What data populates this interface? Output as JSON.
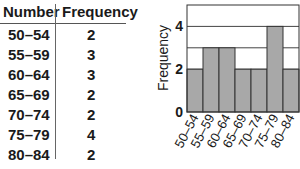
{
  "table": {
    "headers": [
      "Number",
      "Frequency"
    ],
    "rows": [
      [
        "50–54",
        "2"
      ],
      [
        "55–59",
        "3"
      ],
      [
        "60–64",
        "3"
      ],
      [
        "65–69",
        "2"
      ],
      [
        "70–74",
        "2"
      ],
      [
        "75–79",
        "4"
      ],
      [
        "80–84",
        "2"
      ]
    ]
  },
  "chart_data": {
    "type": "bar",
    "title": "",
    "xlabel": "",
    "ylabel": "Frequency",
    "categories": [
      "50–54",
      "55–59",
      "60–64",
      "65–69",
      "70–74",
      "75–79",
      "80–84"
    ],
    "values": [
      2,
      3,
      3,
      2,
      2,
      4,
      2
    ],
    "yticks": [
      "0",
      "2",
      "4"
    ],
    "ylim": [
      0,
      5
    ],
    "grid": true,
    "bar_color": "#a8a8a8",
    "legend": null
  }
}
